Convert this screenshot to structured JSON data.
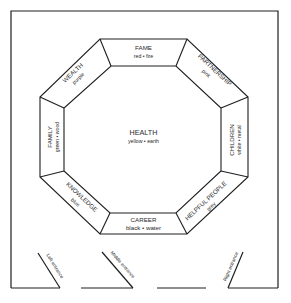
{
  "diagram": {
    "type": "bagua-floor-plan",
    "center": {
      "title": "HEALTH",
      "subtitle": "yellow • earth"
    },
    "areas": [
      {
        "id": "fame",
        "title": "FAME",
        "subtitle": "red • fire"
      },
      {
        "id": "partnership",
        "title": "PARTNERSHIP",
        "subtitle": "pink"
      },
      {
        "id": "children",
        "title": "CHILDREN",
        "subtitle": "white • metal"
      },
      {
        "id": "helpful-people",
        "title": "HELPFUL PEOPLE",
        "subtitle": "grey"
      },
      {
        "id": "career",
        "title": "CAREER",
        "subtitle": "black • water"
      },
      {
        "id": "knowledge",
        "title": "KNOWLEDGE",
        "subtitle": "blue"
      },
      {
        "id": "family",
        "title": "FAMILY",
        "subtitle": "green • wood"
      },
      {
        "id": "wealth",
        "title": "WEALTH",
        "subtitle": "purple"
      }
    ],
    "entrances": [
      {
        "id": "left",
        "label": "Left entrance"
      },
      {
        "id": "middle",
        "label": "Middle entrance"
      },
      {
        "id": "right",
        "label": "Right entrance"
      }
    ],
    "colors": {
      "line": "#1e1e1e",
      "text": "#2a2a2a",
      "background": "#ffffff"
    }
  }
}
